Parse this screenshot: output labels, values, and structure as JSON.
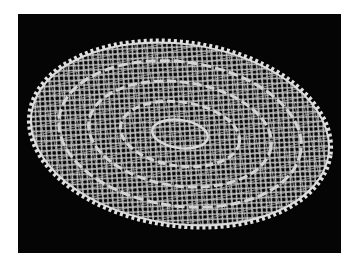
{
  "image": {
    "subject": "white lace oval doily on black background",
    "background_color": "#050505",
    "page_color": "#ffffff",
    "lace_color": "#d9d9d9",
    "caption": ""
  }
}
